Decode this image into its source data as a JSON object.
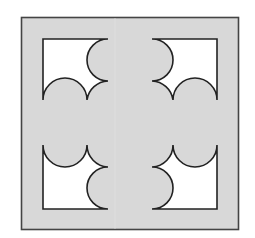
{
  "figure": {
    "colors": {
      "background": "#ffffff",
      "tile_fill": "#d8d8d8",
      "stroke": "#333333",
      "cutout_fill": "#ffffff"
    },
    "outer_square": {
      "x": 21,
      "y": 17,
      "width": 218,
      "height": 213
    }
  }
}
